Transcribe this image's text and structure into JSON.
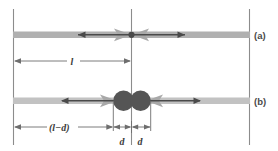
{
  "figure": {
    "rows": [
      {
        "id": "a",
        "label": "(a)",
        "description": "single merged particle at center of rod"
      },
      {
        "id": "b",
        "label": "(b)",
        "description": "two separated particles straddling the center line"
      }
    ],
    "dimensions": [
      {
        "id": "length",
        "label": "l",
        "row": "a",
        "description": "distance from left end to center"
      },
      {
        "id": "length-minus-d",
        "label": "(l−d)",
        "row": "b",
        "description": "distance from left end to left particle edge"
      },
      {
        "id": "d-left",
        "label": "d",
        "row": "b",
        "description": "offset of left particle from center"
      },
      {
        "id": "d-right",
        "label": "d",
        "row": "b",
        "description": "offset of right particle from center"
      }
    ],
    "colors": {
      "rod": "#b3b3b3",
      "rod_dark": "#9a9a9a",
      "particle": "#555555",
      "arrow_dark": "#4a4a4a",
      "arrow_gray": "#a6a6a6",
      "guide_line": "#8c8c8c",
      "dimension_line": "#6e6e6e",
      "background": "#ffffff",
      "text": "#3c3c3c"
    }
  }
}
